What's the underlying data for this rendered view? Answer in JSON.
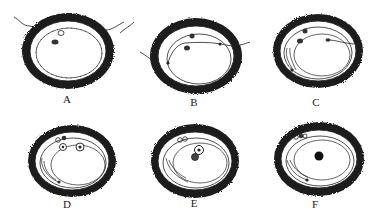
{
  "figure": {
    "colors": {
      "outer_layer": "#1e1e1e",
      "line": "#222222",
      "background": "#ffffff"
    },
    "panels": [
      {
        "label": "A",
        "cx": 68,
        "cy": 50,
        "rx": 46,
        "ry": 38,
        "label_x": 57,
        "label_y": 93
      },
      {
        "label": "B",
        "cx": 195,
        "cy": 55,
        "rx": 46,
        "ry": 38,
        "label_x": 184,
        "label_y": 96
      },
      {
        "label": "C",
        "cx": 318,
        "cy": 50,
        "rx": 45,
        "ry": 37,
        "label_x": 306,
        "label_y": 96
      },
      {
        "label": "D",
        "cx": 72,
        "cy": 160,
        "rx": 44,
        "ry": 36,
        "label_x": 57,
        "label_y": 198
      },
      {
        "label": "E",
        "cx": 195,
        "cy": 160,
        "rx": 44,
        "ry": 37,
        "label_x": 184,
        "label_y": 197
      },
      {
        "label": "F",
        "cx": 319,
        "cy": 158,
        "rx": 45,
        "ry": 37,
        "label_x": 305,
        "label_y": 198
      }
    ]
  }
}
